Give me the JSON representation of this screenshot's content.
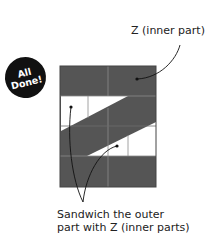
{
  "badge": {
    "line1": "All",
    "line2": "Done!"
  },
  "labels": {
    "top": "Z (inner part)",
    "bottom_line1": "Sandwich the outer",
    "bottom_line2": "part with Z (inner parts)"
  },
  "colors": {
    "block_fill": "#555555",
    "white_fill": "#ffffff",
    "grid_line": "#8a8a8a",
    "leader_line": "#111111",
    "badge_bg": "#111111"
  }
}
